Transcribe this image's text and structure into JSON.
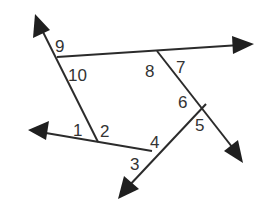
{
  "diagram": {
    "line_color": "#2b2b2b",
    "label_color": "#333333",
    "angle_labels": [
      "1",
      "2",
      "3",
      "4",
      "5",
      "6",
      "7",
      "8",
      "9",
      "10"
    ],
    "lines": [
      {
        "name": "left-transversal",
        "arrow": "up-left"
      },
      {
        "name": "top-line",
        "arrow": "right"
      },
      {
        "name": "right-transversal",
        "arrow": "down-right"
      },
      {
        "name": "bottom-line",
        "arrow": "left"
      },
      {
        "name": "lower-transversal",
        "arrow": "down-left"
      }
    ],
    "intersections": [
      {
        "name": "top-left-vertex",
        "angles": [
          "9",
          "10"
        ]
      },
      {
        "name": "top-right-vertex",
        "angles": [
          "8",
          "7"
        ]
      },
      {
        "name": "right-vertex",
        "angles": [
          "6",
          "5"
        ]
      },
      {
        "name": "bottom-right-vertex",
        "angles": [
          "4",
          "3"
        ]
      },
      {
        "name": "bottom-left-vertex",
        "angles": [
          "1",
          "2"
        ]
      }
    ]
  }
}
